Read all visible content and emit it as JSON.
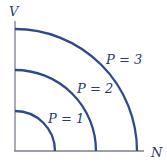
{
  "axes": {
    "y_label": "V",
    "x_label": "N"
  },
  "curves": [
    {
      "label": "P = 1",
      "radius": 40
    },
    {
      "label": "P = 2",
      "radius": 81
    },
    {
      "label": "P = 3",
      "radius": 122
    }
  ],
  "colors": {
    "curve": "#2f4a8c",
    "axis": "#7a7f8a",
    "text": "#2b3a6b"
  }
}
